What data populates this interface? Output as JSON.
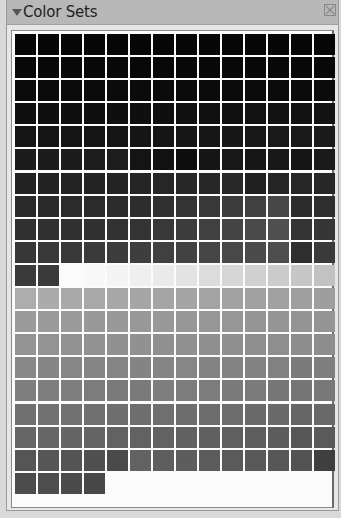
{
  "panel": {
    "title": "Color Sets",
    "collapse_icon": "triangle-down-icon",
    "close_icon": "close-x-icon"
  },
  "swatch_grid": {
    "columns": 14,
    "rows": [
      [
        "#060606",
        "#060606",
        "#060606",
        "#060606",
        "#060606",
        "#060606",
        "#060606",
        "#060606",
        "#060606",
        "#060606",
        "#060606",
        "#060606",
        "#060606",
        "#060606"
      ],
      [
        "#080808",
        "#080808",
        "#080808",
        "#080808",
        "#080808",
        "#080808",
        "#080808",
        "#080808",
        "#080808",
        "#080808",
        "#080808",
        "#080808",
        "#080808",
        "#080808"
      ],
      [
        "#0b0b0b",
        "#0b0b0b",
        "#0b0b0b",
        "#0b0b0b",
        "#0b0b0b",
        "#0b0b0b",
        "#0b0b0b",
        "#0b0b0b",
        "#0b0b0b",
        "#0b0b0b",
        "#0b0b0b",
        "#0b0b0b",
        "#0b0b0b",
        "#0b0b0b"
      ],
      [
        "#0f0f0f",
        "#0f0f0f",
        "#0f0f0f",
        "#0f0f0f",
        "#0f0f0f",
        "#0f0f0f",
        "#0f0f0f",
        "#101010",
        "#101010",
        "#101010",
        "#121212",
        "#121212",
        "#121212",
        "#121212"
      ],
      [
        "#141414",
        "#141414",
        "#141414",
        "#141414",
        "#141414",
        "#151515",
        "#151515",
        "#161616",
        "#161616",
        "#171717",
        "#181818",
        "#191919",
        "#191919",
        "#1a1a1a"
      ],
      [
        "#1c1c1c",
        "#1c1c1c",
        "#1c1c1c",
        "#1d1d1d",
        "#1d1d1d",
        "#141414",
        "#111111",
        "#0d0d0d",
        "#151515",
        "#181818",
        "#161616",
        "#181818",
        "#151515",
        "#1a1a1a"
      ],
      [
        "#222222",
        "#222222",
        "#232323",
        "#232323",
        "#242424",
        "#252525",
        "#262626",
        "#272727",
        "#272727",
        "#282828",
        "#202020",
        "#252525",
        "#262626",
        "#272727"
      ],
      [
        "#2a2a2a",
        "#2a2a2a",
        "#2b2b2b",
        "#2b2b2b",
        "#2c2c2c",
        "#2d2d2d",
        "#303030",
        "#343434",
        "#383838",
        "#3c3c3c",
        "#404040",
        "#474747",
        "#2c2c2c",
        "#2f2f2f"
      ],
      [
        "#303030",
        "#303030",
        "#313131",
        "#313131",
        "#323232",
        "#343434",
        "#383838",
        "#3c3c3c",
        "#404040",
        "#444444",
        "#4a4a4a",
        "#505050",
        "#333333",
        "#363636"
      ],
      [
        "#373737",
        "#383838",
        "#393939",
        "#3a3a3a",
        "#3c3c3c",
        "#3e3e3e",
        "#404040",
        "#424242",
        "#454545",
        "#484848",
        "#4b4b4b",
        "#4e4e4e",
        "#2e2e2e",
        "#3a3a3a"
      ],
      [
        "#3a3a3a",
        "#3a3a3a",
        "#fbfbfb",
        "#f8f8f8",
        "#f4f4f4",
        "#efefef",
        "#eaeaea",
        "#e3e3e3",
        "#dcdcdc",
        "#d6d6d6",
        "#d0d0d0",
        "#cbcbcb",
        "#c6c6c6",
        "#c2c2c2"
      ],
      [
        "#adadad",
        "#ababab",
        "#a9a9a9",
        "#a8a8a8",
        "#a7a7a7",
        "#a6a6a6",
        "#a5a5a5",
        "#a4a4a4",
        "#a3a3a3",
        "#a2a2a2",
        "#a1a1a1",
        "#a0a0a0",
        "#9f9f9f",
        "#9e9e9e"
      ],
      [
        "#9a9a9a",
        "#9a9a9a",
        "#9a9a9a",
        "#999999",
        "#999999",
        "#989898",
        "#989898",
        "#979797",
        "#969696",
        "#969696",
        "#959595",
        "#959595",
        "#949494",
        "#949494"
      ],
      [
        "#939393",
        "#939393",
        "#929292",
        "#929292",
        "#919191",
        "#919191",
        "#909090",
        "#909090",
        "#8f8f8f",
        "#8f8f8f",
        "#8e8e8e",
        "#8e8e8e",
        "#8d8d8d",
        "#8d8d8d"
      ],
      [
        "#888888",
        "#858585",
        "#868686",
        "#858585",
        "#858585",
        "#848484",
        "#858585",
        "#868686",
        "#838383",
        "#838383",
        "#828282",
        "#818181",
        "#7a7a7a",
        "#7e7e7e"
      ],
      [
        "#7f7f7f",
        "#7f7f7f",
        "#7e7e7e",
        "#7c7c7c",
        "#7a7a7a",
        "#7a7a7a",
        "#7e7e7e",
        "#7c7c7c",
        "#7c7c7c",
        "#7a7a7a",
        "#7b7b7b",
        "#777777",
        "#757575",
        "#787878"
      ],
      [
        "#707070",
        "#717171",
        "#717171",
        "#707070",
        "#6e6e6e",
        "#6e6e6e",
        "#6f6f6f",
        "#6d6d6d",
        "#6c6c6c",
        "#6c6c6c",
        "#6a6a6a",
        "#6a6a6a",
        "#666666",
        "#696969"
      ],
      [
        "#666666",
        "#666666",
        "#656565",
        "#646464",
        "#626262",
        "#626262",
        "#626262",
        "#616161",
        "#606060",
        "#5f5f5f",
        "#5e5e5e",
        "#5d5d5d",
        "#575757",
        "#5a5a5a"
      ],
      [
        "#555555",
        "#565656",
        "#545454",
        "#505050",
        "#4a4a4a",
        "#626262",
        "#5e5e5e",
        "#5d5d5d",
        "#5c5c5c",
        "#5a5a5a",
        "#595959",
        "#575757",
        "#525252",
        "#3f3f3f"
      ],
      [
        "#4c4c4c",
        "#4d4d4d",
        "#4b4b4b",
        "#474747"
      ]
    ]
  }
}
